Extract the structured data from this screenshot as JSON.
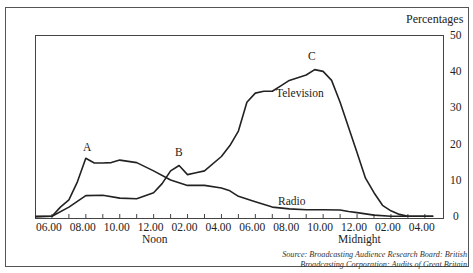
{
  "chart_data": {
    "type": "line",
    "title": "",
    "ylabel": "Percentages",
    "xlabel": "",
    "ylim": [
      0,
      50
    ],
    "yticks": [
      0,
      10,
      20,
      30,
      40,
      50
    ],
    "y_axis_position": "right",
    "grid": false,
    "x_tick_labels": [
      "06.00",
      "08.00",
      "10.00",
      "12.00",
      "02.00",
      "04.00",
      "06.00",
      "08.00",
      "10.00",
      "12.00",
      "02.00",
      "04.00"
    ],
    "x_sublabels": [
      {
        "under": "12.00",
        "index": 3,
        "text": "Noon"
      },
      {
        "under": "12.00",
        "index": 9,
        "text": "Midnight"
      }
    ],
    "x_hours_from_0500": true,
    "series": [
      {
        "name": "Radio",
        "x": [
          0,
          1,
          1.5,
          2,
          2.5,
          3,
          3.5,
          4,
          4.5,
          5,
          6,
          7,
          8,
          9,
          10,
          11,
          11.5,
          12,
          13,
          14,
          15,
          16,
          17,
          18,
          18.5,
          19,
          20,
          21,
          22,
          23,
          23.5
        ],
        "values": [
          0.5,
          0.5,
          3,
          5,
          10,
          16.5,
          15.2,
          15.2,
          15.3,
          16,
          15.3,
          13,
          10.5,
          9,
          9,
          8.3,
          7.5,
          6,
          4.5,
          3,
          2.5,
          2.3,
          2.3,
          2.2,
          1.8,
          1.5,
          0.8,
          0.5,
          0.5,
          0.5,
          0.5
        ]
      },
      {
        "name": "Television",
        "x": [
          0,
          1,
          2,
          3,
          4,
          5,
          6,
          7,
          7.5,
          8,
          8.5,
          9,
          9.5,
          10,
          11,
          11.5,
          12,
          12.5,
          13,
          13.5,
          14,
          14.5,
          15,
          16,
          16.5,
          17,
          17.5,
          18,
          18.5,
          19,
          19.5,
          20,
          20.5,
          21,
          21.5,
          22,
          23,
          23.5
        ],
        "values": [
          0.3,
          0.5,
          3,
          6.2,
          6.3,
          5.5,
          5.3,
          7,
          9.5,
          13,
          14.5,
          12,
          12.5,
          13,
          17,
          20,
          24,
          32,
          34.5,
          35,
          35,
          36.5,
          38,
          39.5,
          41,
          40.5,
          38,
          32,
          25,
          18,
          11,
          7,
          3.5,
          2,
          1,
          0.5,
          0.5,
          0.5
        ]
      }
    ],
    "annotations": [
      {
        "text": "A",
        "note": "Radio morning peak ~08.00"
      },
      {
        "text": "B",
        "note": "Television lunchtime peak ~01.30"
      },
      {
        "text": "C",
        "note": "Television evening peak ~09.30"
      },
      {
        "text": "Television",
        "note": "series label"
      },
      {
        "text": "Radio",
        "note": "series label"
      }
    ]
  },
  "labels": {
    "y_title": "Percentages",
    "y_ticks": [
      "50",
      "40",
      "30",
      "20",
      "10",
      "0"
    ],
    "x_ticks": [
      "06.00",
      "08.00",
      "10.00",
      "12.00",
      "02.00",
      "04.00",
      "06.00",
      "08.00",
      "10.00",
      "12.00",
      "02.00",
      "04.00"
    ],
    "noon": "Noon",
    "midnight": "Midnight",
    "annot_a": "A",
    "annot_b": "B",
    "annot_c": "C",
    "television": "Television",
    "radio": "Radio",
    "source_line1": "Source: Broadcasting Audience Research Board: British",
    "source_line2": "Broadcasting Corporation: Audits of Great Britain"
  }
}
